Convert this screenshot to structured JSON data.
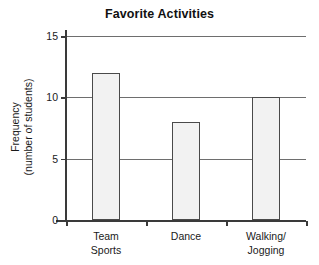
{
  "chart_data": {
    "type": "bar",
    "title": "Favorite Activities",
    "categories": [
      "Team Sports",
      "Dance",
      "Walking/ Jogging"
    ],
    "category_lines": [
      [
        "Team",
        "Sports"
      ],
      [
        "Dance"
      ],
      [
        "Walking/",
        "Jogging"
      ]
    ],
    "values": [
      12,
      8,
      10
    ],
    "xlabel": "",
    "ylabel": "Frequency (number of students)",
    "ylabel_lines": [
      "Frequency",
      "(number of students)"
    ],
    "ylim": [
      0,
      15
    ],
    "yticks": [
      0,
      5,
      10,
      15
    ],
    "ytick_labels": [
      "0",
      "5",
      "10",
      "15"
    ],
    "grid": true,
    "grid_axis": "y",
    "legend": null,
    "bar_fill_color": "#f2f2f2",
    "bar_border_color": "#4a4a4a",
    "gridline_color": "#6e6e6e",
    "axis_color": "#3a3a3a"
  }
}
